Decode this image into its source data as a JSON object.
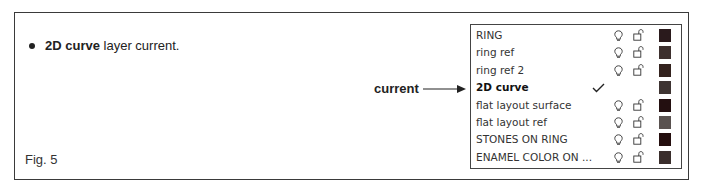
{
  "figure": {
    "bullet": {
      "bold_text": "2D curve",
      "rest_text": " layer current."
    },
    "caption": "Fig. 5",
    "callout": {
      "label": "current",
      "arrow_icon": "right-arrow-icon"
    }
  },
  "layers_panel": {
    "current_layer": "2D curve",
    "rows": [
      {
        "name": "RING",
        "current": false,
        "visible_icon": "bulb-icon",
        "lock_icon": "unlocked-padlock-icon",
        "color": "#2a1a1c"
      },
      {
        "name": "ring ref",
        "current": false,
        "visible_icon": "bulb-icon",
        "lock_icon": "unlocked-padlock-icon",
        "color": "#3d302e"
      },
      {
        "name": "ring ref 2",
        "current": false,
        "visible_icon": "bulb-icon",
        "lock_icon": "unlocked-padlock-icon",
        "color": "#33221e"
      },
      {
        "name": "2D curve",
        "current": true,
        "current_icon": "checkmark-icon",
        "color": "#3e3432"
      },
      {
        "name": "flat layout surface",
        "current": false,
        "visible_icon": "bulb-icon",
        "lock_icon": "unlocked-padlock-icon",
        "color": "#230f10"
      },
      {
        "name": "flat layout ref",
        "current": false,
        "visible_icon": "bulb-icon",
        "lock_icon": "unlocked-padlock-icon",
        "color": "#5a5250"
      },
      {
        "name": "STONES ON RING",
        "current": false,
        "visible_icon": "bulb-icon",
        "lock_icon": "unlocked-padlock-icon",
        "color": "#240e0e"
      },
      {
        "name": "ENAMEL COLOR ON ...",
        "current": false,
        "visible_icon": "bulb-icon",
        "lock_icon": "unlocked-padlock-icon",
        "color": "#3a2e2c"
      }
    ]
  }
}
